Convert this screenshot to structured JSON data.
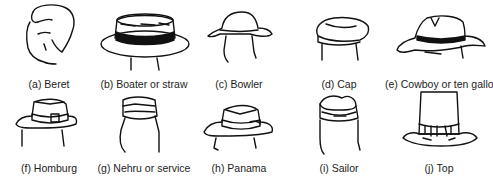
{
  "figure": {
    "items": [
      {
        "id": "a",
        "label": "(a) Beret",
        "icon": "beret-icon"
      },
      {
        "id": "b",
        "label": "(b) Boater or straw",
        "icon": "boater-hat-icon"
      },
      {
        "id": "c",
        "label": "(c) Bowler",
        "icon": "bowler-hat-icon"
      },
      {
        "id": "d",
        "label": "(d) Cap",
        "icon": "cap-icon"
      },
      {
        "id": "e",
        "label": "(e) Cowboy or ten gallon",
        "icon": "cowboy-hat-icon"
      },
      {
        "id": "f",
        "label": "(f) Homburg",
        "icon": "homburg-hat-icon"
      },
      {
        "id": "g",
        "label": "(g) Nehru or service",
        "icon": "nehru-cap-icon"
      },
      {
        "id": "h",
        "label": "(h) Panama",
        "icon": "panama-hat-icon"
      },
      {
        "id": "i",
        "label": "(i) Sailor",
        "icon": "sailor-hat-icon"
      },
      {
        "id": "j",
        "label": "(j) Top",
        "icon": "top-hat-icon"
      }
    ]
  }
}
